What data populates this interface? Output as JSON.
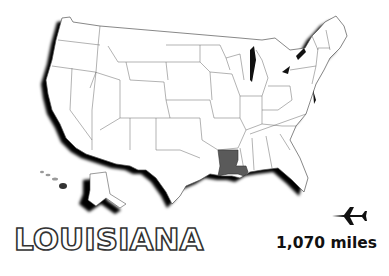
{
  "map": {
    "region": "United States",
    "highlighted_state": "Louisiana",
    "highlight_color": "#5a5a5a",
    "land_color": "#ffffff",
    "border_color": "#555555",
    "shadow_color": "#000000"
  },
  "title": "LOUISIANA",
  "travel": {
    "icon": "airplane-icon",
    "distance": "1,070 miles"
  }
}
